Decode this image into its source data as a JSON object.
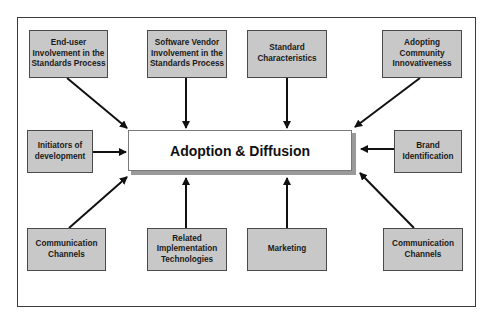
{
  "diagram": {
    "center": {
      "label": "Adoption & Diffusion"
    },
    "factors": {
      "top": [
        {
          "label": "End-user Involvement in the Standards Process"
        },
        {
          "label": "Software Vendor Involvement in the Standards Process"
        },
        {
          "label": "Standard Characteristics"
        },
        {
          "label": "Adopting Community Innovativeness"
        }
      ],
      "middle": [
        {
          "label": "Initiators of development"
        },
        {
          "label": "Brand Identification"
        }
      ],
      "bottom": [
        {
          "label": "Communication Channels"
        },
        {
          "label": "Related Implementation Technologies"
        },
        {
          "label": "Marketing"
        },
        {
          "label": "Communication Channels"
        }
      ]
    },
    "colors": {
      "factor_fill": "#c8c8c8",
      "center_fill": "#ffffff",
      "line": "#111111"
    }
  }
}
